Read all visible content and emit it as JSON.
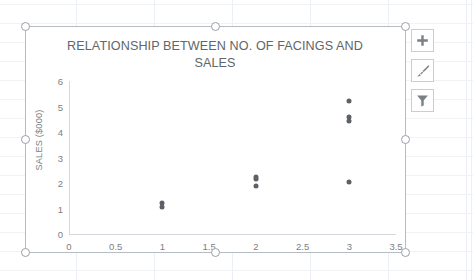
{
  "app": {
    "context": "excel-worksheet",
    "chart_selected": true
  },
  "chart": {
    "title": "RELATIONSHIP BETWEEN NO. OF FACINGS AND SALES",
    "y_axis_title": "SALES ($000)",
    "marker_color": "#5d6165",
    "axis_color": "#d5d8dc",
    "text_color": "#7c8084",
    "title_color": "#616669",
    "selection_border_color": "#b7bcc2"
  },
  "chart_data": {
    "type": "scatter",
    "title": "RELATIONSHIP BETWEEN NO. OF FACINGS AND SALES",
    "xlabel": "",
    "ylabel": "SALES ($000)",
    "xlim": [
      0,
      3.5
    ],
    "ylim": [
      0,
      6
    ],
    "grid": false,
    "legend": false,
    "x_ticks": [
      "0",
      "0.5",
      "1",
      "1.5",
      "2",
      "2.5",
      "3",
      "3.5"
    ],
    "x_tick_values": [
      0,
      0.5,
      1,
      1.5,
      2,
      2.5,
      3,
      3.5
    ],
    "y_ticks": [
      "0",
      "1",
      "2",
      "3",
      "4",
      "5",
      "6"
    ],
    "y_tick_values": [
      0,
      1,
      2,
      3,
      4,
      5,
      6
    ],
    "series": [
      {
        "name": "Sales",
        "color": "#5d6165",
        "points": [
          {
            "x": 1,
            "y": 1.05
          },
          {
            "x": 1,
            "y": 1.2
          },
          {
            "x": 2,
            "y": 1.9
          },
          {
            "x": 2,
            "y": 2.15
          },
          {
            "x": 2,
            "y": 2.25
          },
          {
            "x": 3,
            "y": 2.05
          },
          {
            "x": 3,
            "y": 4.45
          },
          {
            "x": 3,
            "y": 4.6
          },
          {
            "x": 3,
            "y": 5.2
          }
        ]
      }
    ]
  },
  "chart_buttons": [
    {
      "name": "chart-elements-button",
      "icon": "plus-icon",
      "label": "Chart Elements"
    },
    {
      "name": "chart-styles-button",
      "icon": "paintbrush-icon",
      "label": "Chart Styles"
    },
    {
      "name": "chart-filters-button",
      "icon": "funnel-icon",
      "label": "Chart Filters"
    }
  ],
  "selection_handles": [
    "top-left",
    "top-middle",
    "top-right",
    "middle-left",
    "middle-right",
    "bottom-left",
    "bottom-middle",
    "bottom-right"
  ]
}
